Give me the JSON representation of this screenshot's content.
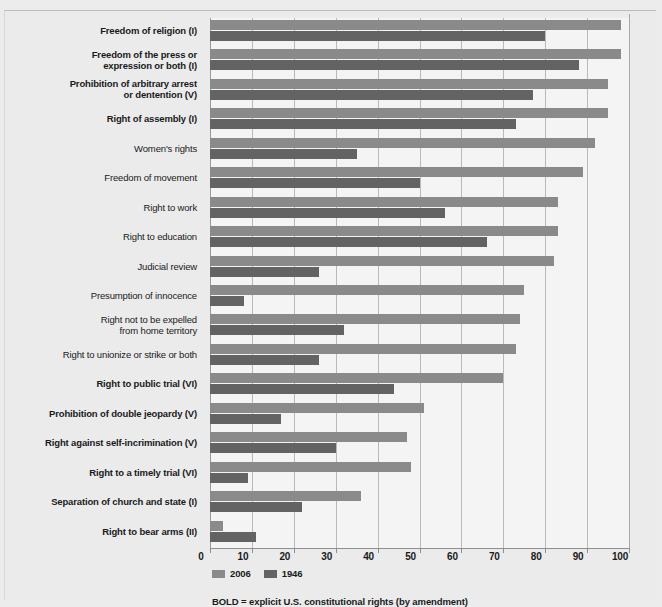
{
  "chart_data": {
    "type": "bar",
    "orientation": "horizontal",
    "title": "",
    "xlabel": "",
    "ylabel": "",
    "xlim": [
      0,
      100
    ],
    "xticks": [
      0,
      10,
      20,
      30,
      40,
      50,
      60,
      70,
      80,
      90,
      100
    ],
    "grid": true,
    "legend_position": "bottom-left",
    "categories": [
      "Freedom of religion (I)",
      "Freedom of the press or expression or both (I)",
      "Prohibition of arbitrary arrest or dentention (V)",
      "Right of assembly (I)",
      "Women's rights",
      "Freedom of movement",
      "Right to work",
      "Right to education",
      "Judicial review",
      "Presumption of innocence",
      "Right not to be expelled from home territory",
      "Right to unionize or strike or both",
      "Right to public trial (VI)",
      "Prohibition of double jeopardy (V)",
      "Right against self-incrimination (V)",
      "Right to a timely trial (VI)",
      "Separation of church and state (I)",
      "Right to bear arms (II)"
    ],
    "series": [
      {
        "name": "2006",
        "color": "#8a8a8a",
        "values": [
          98,
          98,
          95,
          95,
          92,
          89,
          83,
          83,
          82,
          75,
          74,
          73,
          70,
          51,
          47,
          48,
          36,
          3
        ]
      },
      {
        "name": "1946",
        "color": "#636363",
        "values": [
          80,
          88,
          77,
          73,
          35,
          50,
          56,
          66,
          26,
          8,
          32,
          26,
          44,
          17,
          30,
          9,
          22,
          11
        ]
      }
    ],
    "annotations": [
      "BOLD = explicit U.S. constitutional rights (by amendment)"
    ]
  },
  "axis": {
    "tick_labels": [
      "0",
      "10",
      "20",
      "30",
      "40",
      "50",
      "60",
      "70",
      "80",
      "90",
      "100"
    ]
  },
  "categories": [
    {
      "lines": [
        "Freedom of religion (I)"
      ],
      "bold": true
    },
    {
      "lines": [
        "Freedom of the press or",
        "expression or both (I)"
      ],
      "bold": true
    },
    {
      "lines": [
        "Prohibition of arbitrary arrest",
        "or dentention (V)"
      ],
      "bold": true
    },
    {
      "lines": [
        "Right of assembly (I)"
      ],
      "bold": true
    },
    {
      "lines": [
        "Women's rights"
      ],
      "bold": false
    },
    {
      "lines": [
        "Freedom of movement"
      ],
      "bold": false
    },
    {
      "lines": [
        "Right to work"
      ],
      "bold": false
    },
    {
      "lines": [
        "Right to education"
      ],
      "bold": false
    },
    {
      "lines": [
        "Judicial review"
      ],
      "bold": false
    },
    {
      "lines": [
        "Presumption of innocence"
      ],
      "bold": false
    },
    {
      "lines": [
        "Right not to be expelled",
        "from home territory"
      ],
      "bold": false
    },
    {
      "lines": [
        "Right to unionize or strike or both"
      ],
      "bold": false
    },
    {
      "lines": [
        "Right to public trial (VI)"
      ],
      "bold": true
    },
    {
      "lines": [
        "Prohibition of double jeopardy (V)"
      ],
      "bold": true
    },
    {
      "lines": [
        "Right against self-incrimination (V)"
      ],
      "bold": true
    },
    {
      "lines": [
        "Right to a timely trial (VI)"
      ],
      "bold": true
    },
    {
      "lines": [
        "Separation of church and state (I)"
      ],
      "bold": true
    },
    {
      "lines": [
        "Right to bear arms (II)"
      ],
      "bold": true
    }
  ],
  "legend": {
    "items": [
      {
        "label": "2006",
        "color": "#8a8a8a"
      },
      {
        "label": "1946",
        "color": "#636363"
      }
    ]
  },
  "footnote": {
    "text": "BOLD = explicit U.S. constitutional rights (by amendment)"
  }
}
